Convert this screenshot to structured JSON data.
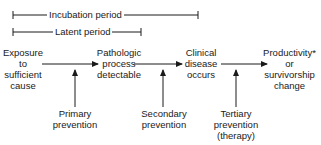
{
  "periods": {
    "incubation": "Incubation period",
    "latent": "Latent period"
  },
  "stages": [
    {
      "line1": "Exposure",
      "line2": "to",
      "line3": "sufficient",
      "line4": "cause"
    },
    {
      "line1": "Pathologic",
      "line2": "process",
      "line3": "detectable"
    },
    {
      "line1": "Clinical",
      "line2": "disease",
      "line3": "occurs"
    },
    {
      "line1": "Productivity*",
      "line2": "or",
      "line3": "survivorship",
      "line4": "change"
    }
  ],
  "preventions": [
    {
      "line1": "Primary",
      "line2": "prevention"
    },
    {
      "line1": "Secondary",
      "line2": "prevention"
    },
    {
      "line1": "Tertiary",
      "line2": "prevention",
      "line3": "(therapy)"
    }
  ]
}
